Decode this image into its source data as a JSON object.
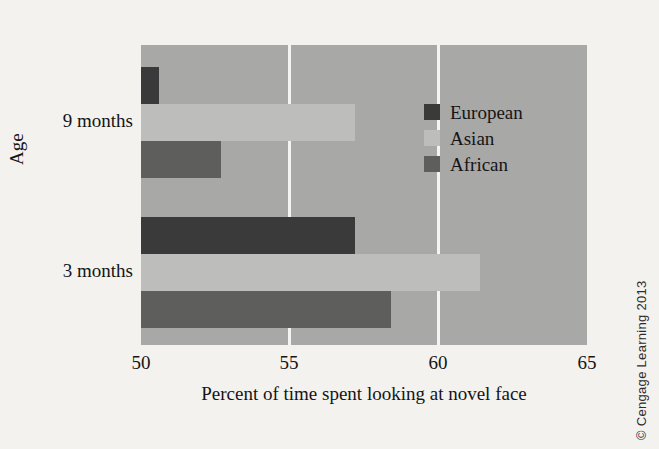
{
  "chart_data": {
    "type": "bar",
    "orientation": "horizontal",
    "title": "",
    "xlabel": "Percent of time spent looking at novel face",
    "ylabel": "Age",
    "xlim": [
      50,
      65
    ],
    "xticks": [
      "50",
      "55",
      "60",
      "65"
    ],
    "xtick_values": [
      50,
      55,
      60,
      65
    ],
    "gridlines": [
      55,
      60
    ],
    "grid": true,
    "legend_position": "inside-right-upper",
    "categories": [
      "3 months",
      "9 months"
    ],
    "series": [
      {
        "name": "European",
        "color": "#3a3a3a",
        "values": [
          57.2,
          50.6
        ]
      },
      {
        "name": "Asian",
        "color": "#bdbdbb",
        "values": [
          61.4,
          57.2
        ]
      },
      {
        "name": "African",
        "color": "#5e5e5c",
        "values": [
          58.4,
          52.7
        ]
      }
    ],
    "plot_background": "#a8a8a6",
    "gridline_color": "#f4f4f2"
  },
  "axes": {
    "y_title": "Age",
    "x_title": "Percent of time spent looking at novel face",
    "y_categories": [
      {
        "label": "9 months"
      },
      {
        "label": "3 months"
      }
    ],
    "x_ticks": [
      {
        "label": "50"
      },
      {
        "label": "55"
      },
      {
        "label": "60"
      },
      {
        "label": "65"
      }
    ]
  },
  "legend": {
    "items": [
      {
        "label": "European",
        "color": "#3a3a3a"
      },
      {
        "label": "Asian",
        "color": "#bdbdbb"
      },
      {
        "label": "African",
        "color": "#5e5e5c"
      }
    ]
  },
  "credit": {
    "text": "© Cengage Learning 2013"
  }
}
